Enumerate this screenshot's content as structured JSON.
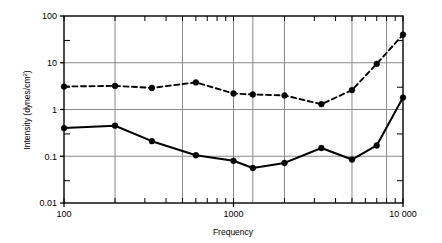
{
  "chart_data": {
    "type": "line",
    "title": "",
    "xlabel": "Frequency",
    "ylabel": "Intensity (dynes/cm²)",
    "ylabel_base": "Intensity (dynes/cm",
    "ylabel_sup": "2",
    "ylabel_tail": ")",
    "xscale": "log",
    "yscale": "log",
    "xlim": [
      100,
      10000
    ],
    "ylim": [
      0.01,
      100
    ],
    "grid": true,
    "legend": "none",
    "x_tick_labels": [
      "100",
      "1000",
      "10 000"
    ],
    "x_tick_values": [
      100,
      1000,
      10000
    ],
    "y_tick_labels": [
      "100",
      "10",
      "1",
      "0.1",
      "0.01"
    ],
    "y_tick_values": [
      100,
      10,
      1,
      0.1,
      0.01
    ],
    "x_major_gridlines": [
      100,
      200,
      500,
      1000,
      1300,
      2000,
      5000,
      8000,
      10000
    ],
    "y_major_gridlines": [
      10,
      1,
      0.1
    ],
    "x": [
      100,
      200,
      330,
      600,
      1000,
      1300,
      2000,
      3300,
      5000,
      7000,
      10000
    ],
    "series": [
      {
        "name": "upper-dashed",
        "style": "dashed",
        "marker": "filled-circle",
        "values": [
          3.1,
          3.2,
          2.9,
          3.8,
          2.2,
          2.1,
          2.0,
          1.3,
          2.6,
          9.5,
          40
        ]
      },
      {
        "name": "lower-solid",
        "style": "solid",
        "marker": "filled-circle",
        "values": [
          0.4,
          0.45,
          0.21,
          0.105,
          0.08,
          0.056,
          0.072,
          0.15,
          0.085,
          0.17,
          1.8
        ]
      }
    ],
    "colors": {
      "line": "#000000",
      "grid": "#8a8a8a",
      "frame": "#000000",
      "background": "#ffffff"
    }
  },
  "layout": {
    "plot_left": 64,
    "plot_right": 403,
    "plot_top": 16,
    "plot_bottom": 203
  }
}
